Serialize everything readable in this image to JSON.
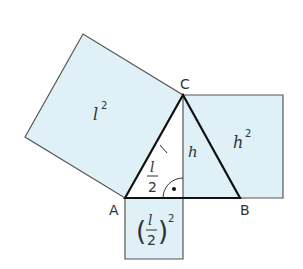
{
  "diagram": {
    "points": {
      "A": "A",
      "B": "B",
      "C": "C"
    },
    "labels": {
      "left_square": "l",
      "left_square_exp": "2",
      "right_square": "h",
      "right_square_exp": "2",
      "bottom_square_num": "l",
      "bottom_square_den": "2",
      "bottom_square_exp": "2",
      "side_l": "l",
      "height_h": "h",
      "half_num": "l",
      "half_den": "2"
    },
    "colors": {
      "fill": "#dff0f7",
      "stroke": "#555555",
      "triangle": "#111111"
    }
  }
}
